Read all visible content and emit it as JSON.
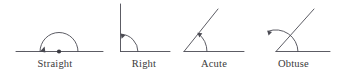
{
  "diagram": {
    "background_color": "#ffffff",
    "stroke_color": "#4a4a52",
    "label_color": "#3a3a3a",
    "figures": [
      {
        "id": "straight",
        "label": "Straight",
        "angle_degrees": 180,
        "arc_marker": "semicircle-arc-with-arrowhead",
        "vertex_marker": "dot",
        "rays": [
          "ray-left-horizontal",
          "ray-right-horizontal"
        ]
      },
      {
        "id": "right",
        "label": "Right",
        "angle_degrees": 90,
        "arc_marker": "quarter-arc-with-arrowhead",
        "vertex_marker": "none",
        "rays": [
          "ray-up-vertical",
          "ray-right-horizontal"
        ]
      },
      {
        "id": "acute",
        "label": "Acute",
        "angle_degrees": 55,
        "arc_marker": "small-arc-with-arrowhead",
        "vertex_marker": "none",
        "rays": [
          "ray-up-right-diagonal",
          "ray-right-horizontal"
        ]
      },
      {
        "id": "obtuse",
        "label": "Obtuse",
        "angle_degrees": 135,
        "arc_marker": "wide-arc-with-arrowhead",
        "vertex_marker": "none",
        "rays": [
          "ray-up-left-diagonal",
          "ray-right-horizontal"
        ]
      }
    ]
  }
}
